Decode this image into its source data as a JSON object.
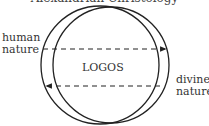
{
  "caption": "Alexandrian Christology",
  "labels": {
    "left_line1": "human",
    "left_line2": "nature",
    "right_line1": "divine",
    "right_line2": "nature",
    "center": "LOGOS"
  },
  "colors": {
    "stroke": "#222222",
    "text": "#333333",
    "background": "#ffffff"
  },
  "shapes": {
    "circle_left": {
      "cx": 100,
      "cy": 65,
      "r": 59
    },
    "circle_right": {
      "cx": 111,
      "cy": 65,
      "r": 58
    },
    "arrow_top": {
      "y": 49,
      "x1": 43,
      "x2": 166,
      "direction": "right"
    },
    "arrow_bottom": {
      "y": 86,
      "x1": 160,
      "x2": 46,
      "direction": "left"
    }
  }
}
